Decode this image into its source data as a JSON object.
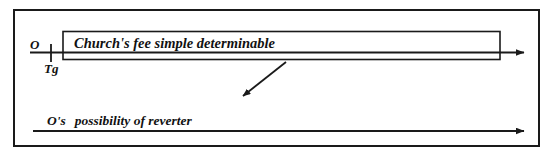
{
  "diagram": {
    "type": "legal-estate-timeline",
    "frame": {
      "border_color": "#1a1a1a"
    },
    "labels": {
      "grantor": "O",
      "grant_time": "Tg",
      "estate_box_text": "Church's fee simple determinable",
      "future_interest_owner": "O's",
      "future_interest_name": "possibility of reverter"
    },
    "lines": {
      "top_timeline_label": "present-estate-timeline",
      "bottom_timeline_label": "future-interest-timeline",
      "pointer_label": "pointer-arrow"
    },
    "colors": {
      "ink": "#1a1a1a",
      "background": "#ffffff"
    }
  }
}
